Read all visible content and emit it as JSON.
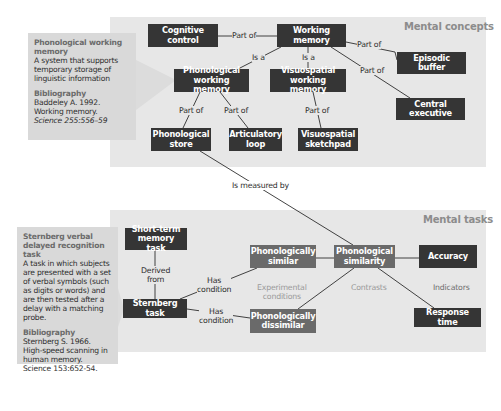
{
  "colors": {
    "panel_bg": "#e7e7e7",
    "info_bg": "#d9d9d9",
    "node_dark": "#353535",
    "node_mid": "#6a6a6a",
    "panel_title": "#8c8c8c",
    "edge_line": "#2e2e2e"
  },
  "concepts_panel": {
    "title": "Mental concepts",
    "nodes": {
      "cognitive_control": "Cognitive control",
      "working_memory": "Working memory",
      "phonological_working_memory": "Phonological working memory",
      "visuospatial_working_memory": "Visuospatial working memory",
      "episodic_buffer": "Episodic buffer",
      "central_executive": "Central executive",
      "phonological_store": "Phonological store",
      "articulatory_loop": "Articulatory loop",
      "visuospatial_sketchpad": "Visuospatial sketchpad"
    },
    "edges": [
      {
        "from": "cognitive_control",
        "to": "working_memory",
        "label": "Part of"
      },
      {
        "from": "phonological_working_memory",
        "to": "working_memory",
        "label": "Is a"
      },
      {
        "from": "visuospatial_working_memory",
        "to": "working_memory",
        "label": "Is a"
      },
      {
        "from": "episodic_buffer",
        "to": "working_memory",
        "label": "Part of"
      },
      {
        "from": "central_executive",
        "to": "working_memory",
        "label": "Part of"
      },
      {
        "from": "phonological_store",
        "to": "phonological_working_memory",
        "label": "Part of"
      },
      {
        "from": "articulatory_loop",
        "to": "phonological_working_memory",
        "label": "Part of"
      },
      {
        "from": "visuospatial_sketchpad",
        "to": "visuospatial_working_memory",
        "label": "Part of"
      }
    ],
    "info": {
      "term": "Phonological working memory",
      "definition": "A system that supports temporary storage of linguistic information",
      "bibliography_heading": "Bibliography",
      "citation_author": "Baddeley A. 1992.",
      "citation_title": "Working memory.",
      "citation_source": "Science 255:556–59"
    }
  },
  "cross_link": {
    "from": "phonological_store",
    "to": "phonological_similarity",
    "label": "Is measured by"
  },
  "tasks_panel": {
    "title": "Mental tasks",
    "nodes": {
      "short_term_memory_task": "Short-term memory task",
      "sternberg_task": "Sternberg task",
      "phonologically_similar": "Phonologically similar",
      "phonologically_dissimilar": "Phonologically dissimilar",
      "phonological_similarity": "Phonological similarity",
      "accuracy": "Accuracy",
      "response_time": "Response time"
    },
    "edges": [
      {
        "from": "sternberg_task",
        "to": "short_term_memory_task",
        "label": "Derived from"
      },
      {
        "from": "sternberg_task",
        "to": "phonologically_similar",
        "label": "Has condition"
      },
      {
        "from": "sternberg_task",
        "to": "phonologically_dissimilar",
        "label": "Has condition"
      },
      {
        "from": "phonologically_similar",
        "to": "phonological_similarity",
        "label": ""
      },
      {
        "from": "phonologically_dissimilar",
        "to": "phonological_similarity",
        "label": ""
      },
      {
        "from": "phonological_similarity",
        "to": "accuracy",
        "label": ""
      },
      {
        "from": "phonological_similarity",
        "to": "response_time",
        "label": ""
      }
    ],
    "edge_labels": {
      "derived_from_1": "Derived",
      "derived_from_2": "from",
      "has_condition_1a": "Has",
      "has_condition_1b": "condition",
      "has_condition_2a": "Has",
      "has_condition_2b": "condition"
    },
    "groups": {
      "experimental_conditions_1": "Experimental",
      "experimental_conditions_2": "conditions",
      "contrasts": "Contrasts",
      "indicators": "Indicators"
    },
    "info": {
      "term": "Sternberg verbal delayed recognition task",
      "definition": "A task in which subjects are presented with a set of verbal symbols (such as digits or words) and are then tested after a delay with a matching probe.",
      "bibliography_heading": "Bibliography",
      "citation_author": "Sternberg S. 1966.",
      "citation_title": "High-speed scanning in human memory.",
      "citation_source": "Science 153:652-54."
    }
  }
}
